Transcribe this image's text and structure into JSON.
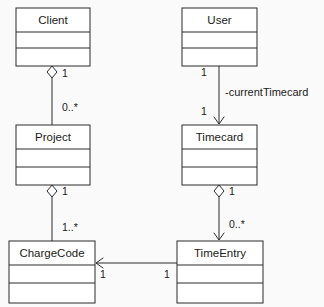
{
  "diagram": {
    "type": "uml-class-diagram",
    "background_color": "#fafafa",
    "line_color": "#2b2b2b",
    "box_fill": "#ffffff",
    "classes": [
      {
        "id": "client",
        "name": "Client",
        "x": 16,
        "y": 8,
        "width": 74,
        "height": 58,
        "divider1": 24,
        "divider2": 40
      },
      {
        "id": "user",
        "name": "User",
        "x": 182,
        "y": 8,
        "width": 75,
        "height": 58,
        "divider1": 24,
        "divider2": 40
      },
      {
        "id": "project",
        "name": "Project",
        "x": 16,
        "y": 125,
        "width": 74,
        "height": 60,
        "divider1": 24,
        "divider2": 42
      },
      {
        "id": "timecard",
        "name": "Timecard",
        "x": 182,
        "y": 125,
        "width": 75,
        "height": 60,
        "divider1": 24,
        "divider2": 42
      },
      {
        "id": "chargecode",
        "name": "ChargeCode",
        "x": 9,
        "y": 241,
        "width": 86,
        "height": 62,
        "divider1": 24,
        "divider2": 42
      },
      {
        "id": "timeentry",
        "name": "TimeEntry",
        "x": 177,
        "y": 241,
        "width": 86,
        "height": 62,
        "divider1": 24,
        "divider2": 42
      }
    ],
    "relationships": [
      {
        "id": "client-project",
        "from": "client",
        "to": "project",
        "kind": "aggregation",
        "source_multiplicity": "1",
        "target_multiplicity": "0..*",
        "role_label": ""
      },
      {
        "id": "user-timecard",
        "from": "user",
        "to": "timecard",
        "kind": "association-directed",
        "source_multiplicity": "1",
        "target_multiplicity": "1",
        "role_label": "-currentTimecard"
      },
      {
        "id": "project-chargecode",
        "from": "project",
        "to": "chargecode",
        "kind": "aggregation",
        "source_multiplicity": "1",
        "target_multiplicity": "1..*",
        "role_label": ""
      },
      {
        "id": "timecard-timeentry",
        "from": "timecard",
        "to": "timeentry",
        "kind": "aggregation-directed",
        "source_multiplicity": "1",
        "target_multiplicity": "0..*",
        "role_label": ""
      },
      {
        "id": "timeentry-chargecode",
        "from": "timeentry",
        "to": "chargecode",
        "kind": "association-directed",
        "source_multiplicity": "1",
        "target_multiplicity": "1",
        "role_label": ""
      }
    ],
    "labels": {
      "client_to_project_source": "1",
      "client_to_project_target": "0..*",
      "user_to_timecard_source": "1",
      "user_to_timecard_target": "1",
      "user_to_timecard_role": "-currentTimecard",
      "project_to_chargecode_source": "1",
      "project_to_chargecode_target": "1..*",
      "timecard_to_timeentry_source": "1",
      "timecard_to_timeentry_target": "0..*",
      "timeentry_to_chargecode_source": "1",
      "timeentry_to_chargecode_target": "1"
    }
  }
}
